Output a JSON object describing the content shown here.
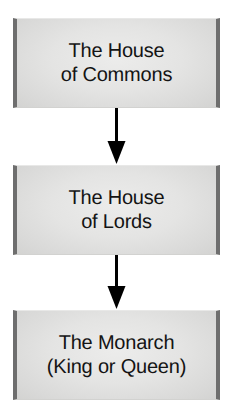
{
  "diagram": {
    "orientation": "vertical",
    "background_color": "#ffffff",
    "node_fill_color": "#e4e4e3",
    "node_edge_bar_color": "#6e6e6e",
    "arrow_color": "#000000",
    "text_color": "#141414",
    "nodes": [
      {
        "id": "commons",
        "label": "The House\nof Commons",
        "line1": "The House",
        "line2": "of Commons"
      },
      {
        "id": "lords",
        "label": "The House\nof Lords",
        "line1": "The House",
        "line2": "of Lords"
      },
      {
        "id": "monarch",
        "label": "The Monarch\n(King or Queen)",
        "line1": "The Monarch",
        "line2": "(King or Queen)"
      }
    ],
    "connectors": [
      {
        "id": "commons-to-lords",
        "from": "commons",
        "to": "lords",
        "direction": "down",
        "style": "solid-arrow"
      },
      {
        "id": "lords-to-monarch",
        "from": "lords",
        "to": "monarch",
        "direction": "down",
        "style": "solid-arrow"
      }
    ]
  }
}
